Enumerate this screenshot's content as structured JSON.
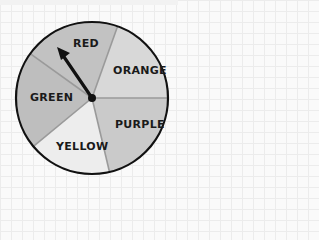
{
  "spinner": {
    "center": {
      "x": 92,
      "y": 98
    },
    "radius": 76,
    "pointer_target": "RED",
    "sectors": [
      {
        "label": "RED",
        "color": "#c2c2c2"
      },
      {
        "label": "ORANGE",
        "color": "#d8d8d8"
      },
      {
        "label": "PURPLE",
        "color": "#cacaca"
      },
      {
        "label": "YELLOW",
        "color": "#ededed"
      },
      {
        "label": "GREEN",
        "color": "#bebebe"
      }
    ],
    "colors": {
      "outline": "#111111",
      "divider": "#9a9a9a",
      "arrow": "#111111"
    }
  }
}
